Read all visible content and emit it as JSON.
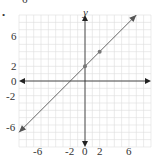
{
  "problem_number": "6",
  "chart_data": {
    "type": "line",
    "title": "",
    "xlabel": "",
    "ylabel": "y",
    "xlim": [
      -9,
      9
    ],
    "ylim": [
      -9,
      9
    ],
    "grid": true,
    "x_ticks": [
      "-6",
      "-2",
      "0",
      "2",
      "6"
    ],
    "y_ticks": [
      "6",
      "2",
      "0",
      "-2",
      "-6"
    ],
    "series": [
      {
        "name": "line",
        "equation": "y = x + 2",
        "slope": 1,
        "intercept": 2,
        "x": [
          -9,
          7
        ],
        "y": [
          -7,
          9
        ],
        "arrows": "both"
      }
    ],
    "points": [
      {
        "x": 0,
        "y": 2
      },
      {
        "x": 2,
        "y": 4
      }
    ],
    "colors": {
      "grid": "#dddddd",
      "axis": "#222222",
      "line": "#555555",
      "point": "#777777"
    }
  }
}
